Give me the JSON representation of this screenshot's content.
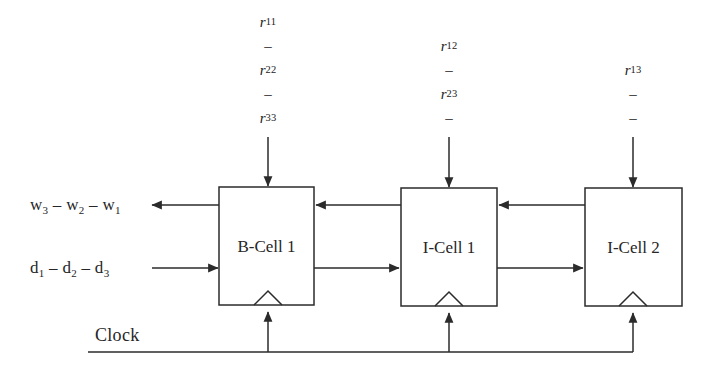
{
  "diagram": {
    "line_color": "#2b2b2b",
    "background": "#ffffff",
    "cells": [
      {
        "id": "b-cell-1",
        "label": "B-Cell 1",
        "x": 219,
        "y": 187,
        "w": 95,
        "h": 118
      },
      {
        "id": "i-cell-1",
        "label": "I-Cell 1",
        "x": 401,
        "y": 188,
        "w": 96,
        "h": 118
      },
      {
        "id": "i-cell-2",
        "label": "I-Cell 2",
        "x": 585,
        "y": 188,
        "w": 97,
        "h": 118
      }
    ],
    "input_streams": [
      {
        "id": "stream-b-cell-1",
        "x": 268,
        "top": 10,
        "rows": [
          "r11",
          "-",
          "r22",
          "-",
          "r33"
        ],
        "rows_display": [
          {
            "base": "r",
            "sub": "11"
          },
          {
            "base": "–",
            "sub": ""
          },
          {
            "base": "r",
            "sub": "22"
          },
          {
            "base": "–",
            "sub": ""
          },
          {
            "base": "r",
            "sub": "33"
          }
        ]
      },
      {
        "id": "stream-i-cell-1",
        "x": 449,
        "top": 34,
        "rows": [
          "r12",
          "-",
          "r23",
          "-"
        ],
        "rows_display": [
          {
            "base": "r",
            "sub": "12"
          },
          {
            "base": "–",
            "sub": ""
          },
          {
            "base": "r",
            "sub": "23"
          },
          {
            "base": "–",
            "sub": ""
          }
        ]
      },
      {
        "id": "stream-i-cell-2",
        "x": 633,
        "top": 58,
        "rows": [
          "r13",
          "-",
          "-"
        ],
        "rows_display": [
          {
            "base": "r",
            "sub": "13"
          },
          {
            "base": "–",
            "sub": ""
          },
          {
            "base": "–",
            "sub": ""
          }
        ]
      }
    ],
    "output_label": {
      "id": "w-output",
      "text_parts": [
        "w",
        "3",
        " – ",
        "w",
        "2",
        " – ",
        "w",
        "1"
      ],
      "x": 30,
      "y": 196
    },
    "input_label": {
      "id": "d-input",
      "text_parts": [
        "d",
        "1",
        " – ",
        "d",
        "2",
        " – ",
        "d",
        "3"
      ],
      "x": 30,
      "y": 259
    },
    "clock": {
      "label": "Clock",
      "label_x": 95,
      "label_y": 325,
      "bus_y": 352,
      "bus_x_start": 88,
      "bus_x_end": 633,
      "taps": [
        268,
        449,
        633
      ]
    },
    "feedback_line_y": 205,
    "forward_line_y": 268
  },
  "labels": {
    "output": "w3 - w2 - w1",
    "input": "d1 - d2 - d3",
    "clock": "Clock",
    "cell1": "B-Cell 1",
    "cell2": "I-Cell 1",
    "cell3": "I-Cell 2"
  }
}
